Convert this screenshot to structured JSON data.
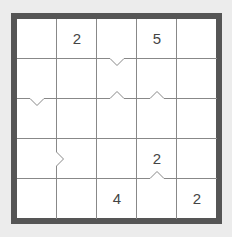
{
  "puzzle": {
    "rows": 5,
    "cols": 5,
    "colors": {
      "background": "#ececec",
      "frame": "#555555",
      "cell": "#ffffff",
      "grid_line": "#888888",
      "clue_text": "#444444"
    },
    "clues": [
      {
        "row": 0,
        "col": 1,
        "value": "2"
      },
      {
        "row": 0,
        "col": 3,
        "value": "5"
      },
      {
        "row": 3,
        "col": 3,
        "value": "2"
      },
      {
        "row": 4,
        "col": 2,
        "value": "4"
      },
      {
        "row": 4,
        "col": 4,
        "value": "2"
      }
    ],
    "notches": [
      {
        "edge": "horizontal",
        "line": 1,
        "cell": 2,
        "direction": "down"
      },
      {
        "edge": "horizontal",
        "line": 2,
        "cell": 0,
        "direction": "down"
      },
      {
        "edge": "horizontal",
        "line": 2,
        "cell": 2,
        "direction": "up"
      },
      {
        "edge": "horizontal",
        "line": 2,
        "cell": 3,
        "direction": "up"
      },
      {
        "edge": "vertical",
        "line": 1,
        "cell": 3,
        "direction": "right"
      },
      {
        "edge": "horizontal",
        "line": 4,
        "cell": 3,
        "direction": "up"
      }
    ]
  }
}
